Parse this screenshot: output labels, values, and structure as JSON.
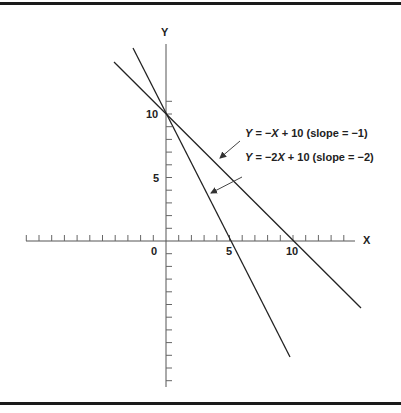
{
  "chart_data": {
    "type": "line",
    "title": "",
    "xlabel": "X",
    "ylabel": "Y",
    "x_ticks_labeled": [
      "0",
      "5",
      "10"
    ],
    "y_ticks_labeled": [
      "5",
      "10"
    ],
    "xlim": [
      -11,
      15
    ],
    "ylim": [
      -11.5,
      15
    ],
    "grid": false,
    "series": [
      {
        "name": "Y = −X + 10 (slope = −1)",
        "slope": -1,
        "intercept": 10,
        "x": [
          -4,
          15.5
        ],
        "y": [
          14,
          -5.5
        ]
      },
      {
        "name": "Y = −2X + 10 (slope = −2)",
        "slope": -2,
        "intercept": 10,
        "x": [
          -2.6,
          9.8
        ],
        "y": [
          15.2,
          -9.6
        ]
      }
    ],
    "annotations": [
      {
        "text": "Y = −X + 10 (slope = −1)",
        "arrow_to": "line slope −1"
      },
      {
        "text": "Y = −2X + 10 (slope = −2)",
        "arrow_to": "line slope −2"
      }
    ]
  },
  "axes": {
    "x_label": "X",
    "y_label": "Y",
    "origin": "0",
    "x5": "5",
    "x10": "10",
    "y5": "5",
    "y10": "10"
  },
  "labels": {
    "eq1_a": "Y",
    "eq1_b": " = −",
    "eq1_c": "X",
    "eq1_d": " + 10 (slope = −1)",
    "eq2_a": "Y",
    "eq2_b": " = −2",
    "eq2_c": "X",
    "eq2_d": " + 10 (slope = −2)"
  }
}
